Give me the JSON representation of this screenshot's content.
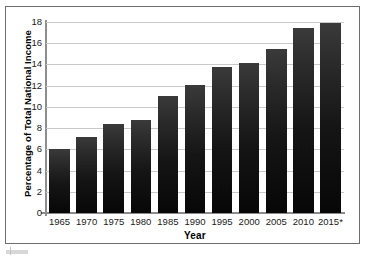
{
  "chart_data": {
    "type": "bar",
    "title": "",
    "xlabel": "Year",
    "ylabel": "Percentage of Total National Income",
    "categories": [
      "1965",
      "1970",
      "1975",
      "1980",
      "1985",
      "1990",
      "1995",
      "2000",
      "2005",
      "2010",
      "2015*"
    ],
    "values": [
      6.0,
      7.2,
      8.4,
      8.8,
      11.0,
      12.1,
      13.8,
      14.1,
      15.5,
      17.4,
      17.9
    ],
    "ylim": [
      0,
      18
    ],
    "yticks": [
      0,
      2,
      4,
      6,
      8,
      10,
      12,
      14,
      16,
      18
    ],
    "ytick_labels": [
      "0",
      "2",
      "4",
      "6",
      "8",
      "10",
      "12",
      "14",
      "16",
      "18"
    ],
    "grid": true,
    "legend": false,
    "bar_color": "#121212",
    "grid_color": "#c9c9c9",
    "axis_color": "#8e8e8e",
    "background": "#ffffff",
    "footnote_marker": "*"
  }
}
